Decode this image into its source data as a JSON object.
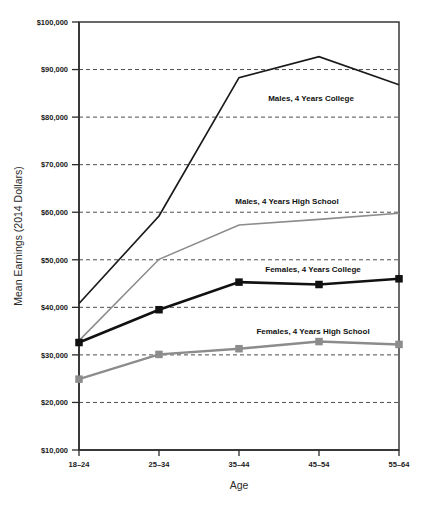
{
  "chart_data": {
    "type": "line",
    "title": "",
    "xlabel": "Age",
    "ylabel": "Mean Earnings (2014 Dollars)",
    "categories": [
      "18–24",
      "25–34",
      "35–44",
      "45–54",
      "55–64"
    ],
    "ylim": [
      10000,
      100000
    ],
    "ytick_labels": [
      "$10,000",
      "$20,000",
      "$30,000",
      "$40,000",
      "$50,000",
      "$60,000",
      "$70,000",
      "$80,000",
      "$90,000",
      "$100,000"
    ],
    "ytick_values": [
      10000,
      20000,
      30000,
      40000,
      50000,
      60000,
      70000,
      80000,
      90000,
      100000
    ],
    "grid": true,
    "legend_position": "inline-annotations",
    "series": [
      {
        "name": "Males, 4 Years College",
        "values": [
          40800,
          59200,
          88300,
          92700,
          86800
        ],
        "color": "#1a1a1a",
        "line_width": 1.7,
        "marker": "none"
      },
      {
        "name": "Males, 4 Years High School",
        "values": [
          33000,
          50100,
          57300,
          58500,
          59800
        ],
        "color": "#8c8c8c",
        "line_width": 1.6,
        "marker": "none"
      },
      {
        "name": "Females, 4 Years College",
        "values": [
          32600,
          39500,
          45300,
          44800,
          46000
        ],
        "color": "#111111",
        "line_width": 2.6,
        "marker": "square"
      },
      {
        "name": "Females, 4 Years High School",
        "values": [
          24900,
          30100,
          31300,
          32800,
          32200
        ],
        "color": "#8c8c8c",
        "line_width": 2.4,
        "marker": "square"
      }
    ],
    "annotations": [
      {
        "text": "Males, 4 Years College",
        "x": 311,
        "y": 101
      },
      {
        "text": "Males, 4 Years High School",
        "x": 287,
        "y": 204
      },
      {
        "text": "Females, 4 Years College",
        "x": 313,
        "y": 272
      },
      {
        "text": "Females, 4 Years High School",
        "x": 313,
        "y": 334
      }
    ]
  }
}
